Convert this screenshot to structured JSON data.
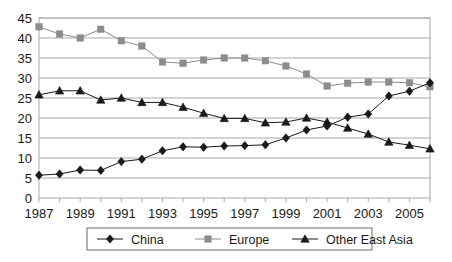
{
  "chart_data": {
    "type": "line",
    "title": "",
    "subtitle": "",
    "xlabel": "",
    "ylabel": "",
    "xlim": [
      1987,
      2006
    ],
    "ylim": [
      0,
      45
    ],
    "ytick_step": 5,
    "grid": true,
    "grid_axis": "y",
    "legend_position": "bottom",
    "x": [
      1987,
      1988,
      1989,
      1990,
      1991,
      1992,
      1993,
      1994,
      1995,
      1996,
      1997,
      1998,
      1999,
      2000,
      2001,
      2002,
      2003,
      2004,
      2005,
      2006
    ],
    "xtick_labels": [
      "1987",
      "",
      "1989",
      "",
      "1991",
      "",
      "1993",
      "",
      "1995",
      "",
      "1997",
      "",
      "1999",
      "",
      "2001",
      "",
      "2003",
      "",
      "2005",
      ""
    ],
    "ytick_labels": [
      "0",
      "5",
      "10",
      "15",
      "20",
      "25",
      "30",
      "35",
      "40",
      "45"
    ],
    "series": [
      {
        "name": "China",
        "marker": "diamond",
        "color": "#1a1a1a",
        "values": [
          5.7,
          6.0,
          7.0,
          6.9,
          9.1,
          9.7,
          11.8,
          12.8,
          12.7,
          13.0,
          13.1,
          13.3,
          15.0,
          17.0,
          18.0,
          20.2,
          21.0,
          25.5,
          26.7,
          28.8
        ]
      },
      {
        "name": "Europe",
        "marker": "square",
        "color": "#8c8c8c",
        "values": [
          42.8,
          41.0,
          40.0,
          42.2,
          39.3,
          38.0,
          34.0,
          33.7,
          34.5,
          35.0,
          35.0,
          34.3,
          33.0,
          31.0,
          28.0,
          28.7,
          29.0,
          29.0,
          28.8,
          27.8
        ]
      },
      {
        "name": "Other East Asia",
        "marker": "triangle",
        "color": "#1a1a1a",
        "values": [
          25.8,
          26.8,
          26.8,
          24.5,
          25.0,
          23.9,
          23.9,
          22.7,
          21.2,
          19.9,
          19.9,
          18.8,
          19.0,
          20.0,
          19.0,
          17.5,
          16.0,
          14.0,
          13.2,
          12.3
        ]
      }
    ]
  },
  "legend": {
    "items": [
      {
        "label": "China"
      },
      {
        "label": "Europe"
      },
      {
        "label": "Other East Asia"
      }
    ]
  },
  "colors": {
    "plot_border": "#a9a9a9",
    "gridline": "#a9a9a9",
    "background": "#ffffff",
    "china": "#1a1a1a",
    "europe": "#8c8c8c",
    "other_east_asia": "#1a1a1a"
  }
}
